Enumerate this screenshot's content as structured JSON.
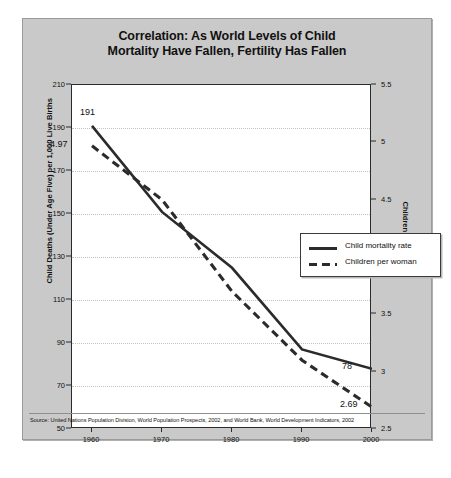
{
  "figure": {
    "title_line1": "Correlation: As World Levels of Child",
    "title_line2": "Mortality Have Fallen, Fertility Has Fallen",
    "source": "Source: United Nations Population Division, World Population Prospects, 2002, and World Bank, World Development Indicators, 2002",
    "bg_color": "#c9c9c9",
    "plot_bg_color": "#ffffff",
    "line_color": "#2b2b2b",
    "grid_color": "#c4c4c4"
  },
  "legend": {
    "position": "inside-top-right",
    "items": [
      {
        "label": "Child mortality rate",
        "style": "solid"
      },
      {
        "label": "Children per woman",
        "style": "dashed"
      }
    ]
  },
  "axes": {
    "x_ticks": [
      "1960",
      "1970",
      "1980",
      "1990",
      "2000"
    ],
    "y_left_label": "Child Deaths (Under Age Five) per 1,000 Live Births",
    "y_left_ticks": [
      "210",
      "190",
      "170",
      "150",
      "130",
      "110",
      "90",
      "70",
      "50"
    ],
    "y_right_label": "Children per Woman",
    "y_right_ticks": [
      "5.5",
      "5",
      "4.5",
      "4",
      "3.5",
      "3",
      "2.5"
    ]
  },
  "annotations": {
    "mortality_start": "191",
    "fertility_start": "4.97",
    "mortality_end": "78",
    "fertility_end": "2.69"
  },
  "chart_data": {
    "type": "line",
    "title": "Correlation: As World Levels of Child Mortality Have Fallen, Fertility Has Fallen",
    "xlabel": "",
    "x": [
      1960,
      1970,
      1980,
      1990,
      2000
    ],
    "series": [
      {
        "name": "Child mortality rate",
        "style": "solid",
        "axis": "left",
        "ylabel": "Child Deaths (Under Age Five) per 1,000 Live Births",
        "ylim": [
          50,
          210
        ],
        "values": [
          191,
          151,
          125,
          87,
          78
        ],
        "point_labels": {
          "1960": "191",
          "2000": "78"
        }
      },
      {
        "name": "Children per woman",
        "style": "dashed",
        "axis": "right",
        "ylabel": "Children per Woman",
        "ylim": [
          2.5,
          5.5
        ],
        "values": [
          4.97,
          4.5,
          3.7,
          3.1,
          2.69
        ],
        "point_labels": {
          "1960": "4.97",
          "2000": "2.69"
        }
      }
    ],
    "xlim": [
      1958,
      2002
    ],
    "grid": true,
    "legend_position": "upper right",
    "source": "Source: United Nations Population Division, World Population Prospects, 2002, and World Bank, World Development Indicators, 2002"
  }
}
